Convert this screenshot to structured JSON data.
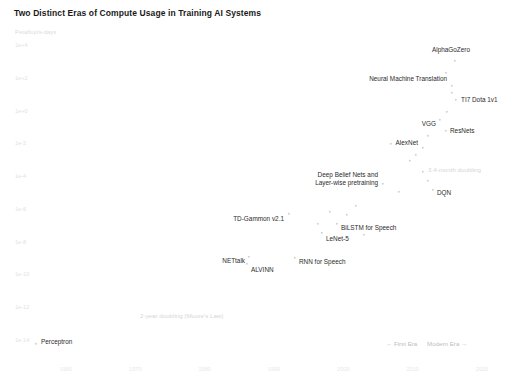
{
  "chart_data": {
    "type": "scatter",
    "title": "Two Distinct Eras of Compute Usage in Training AI Systems",
    "ylabel": "Petaflop/s-days",
    "xlabel": "",
    "xlim": [
      1955,
      2022
    ],
    "ylim_log10": [
      -14,
      4
    ],
    "grid": false,
    "legend_position": "bottom-right",
    "y_ticks": [
      "1e+4",
      "1e+2",
      "1e+0",
      "1e-2",
      "1e-4",
      "1e-6",
      "1e-8",
      "1e-10",
      "1e-12",
      "1e-14"
    ],
    "x_ticks": [
      "1960",
      "1970",
      "1980",
      "1990",
      "2000",
      "2010",
      "2020"
    ],
    "points": [
      {
        "label": "AlphaGoZero",
        "x_px": 455,
        "y_px": 61,
        "lx": 470,
        "ly": 50,
        "align": "right"
      },
      {
        "label": "Neural Machine Translation",
        "x_px": 452,
        "y_px": 86,
        "lx": 447,
        "ly": 79,
        "align": "right"
      },
      {
        "label": "TI7 Dota 1v1",
        "x_px": 456,
        "y_px": 100,
        "lx": 461,
        "ly": 100,
        "align": "left"
      },
      {
        "label": "ResNets",
        "x_px": 446,
        "y_px": 131,
        "lx": 450,
        "ly": 131,
        "align": "left"
      },
      {
        "label": "VGG",
        "x_px": 440,
        "y_px": 120,
        "lx": 436,
        "ly": 124,
        "align": "right"
      },
      {
        "label": "AlexNet",
        "x_px": 423,
        "y_px": 148,
        "lx": 418,
        "ly": 143,
        "align": "right"
      },
      {
        "label": "DQN",
        "x_px": 433,
        "y_px": 190,
        "lx": 437,
        "ly": 193,
        "align": "left"
      },
      {
        "label": "Deep Belief Nets and Layer-wise pretraining",
        "x_px": 383,
        "y_px": 184,
        "lx": 378,
        "ly": 179,
        "align": "right"
      },
      {
        "label": "BiLSTM for Speech",
        "x_px": 337,
        "y_px": 224,
        "lx": 341,
        "ly": 228,
        "align": "left"
      },
      {
        "label": "LeNet-5",
        "x_px": 322,
        "y_px": 233,
        "lx": 326,
        "ly": 239,
        "align": "left"
      },
      {
        "label": "TD-Gammon v2.1",
        "x_px": 289,
        "y_px": 214,
        "lx": 284,
        "ly": 219,
        "align": "right"
      },
      {
        "label": "RNN for Speech",
        "x_px": 295,
        "y_px": 258,
        "lx": 299,
        "ly": 262,
        "align": "left"
      },
      {
        "label": "ALVINN",
        "x_px": 247,
        "y_px": 264,
        "lx": 251,
        "ly": 270,
        "align": "left"
      },
      {
        "label": "NETtalk",
        "x_px": 249,
        "y_px": 257,
        "lx": 245,
        "ly": 261,
        "align": "right"
      },
      {
        "label": "Perceptron",
        "x_px": 36,
        "y_px": 344,
        "lx": 41,
        "ly": 342,
        "align": "left"
      }
    ],
    "extra_dots": [
      {
        "x_px": 446,
        "y_px": 73
      },
      {
        "x_px": 452,
        "y_px": 93
      },
      {
        "x_px": 447,
        "y_px": 112
      },
      {
        "x_px": 428,
        "y_px": 136
      },
      {
        "x_px": 416,
        "y_px": 155
      },
      {
        "x_px": 410,
        "y_px": 161
      },
      {
        "x_px": 423,
        "y_px": 172
      },
      {
        "x_px": 428,
        "y_px": 181
      },
      {
        "x_px": 399,
        "y_px": 192
      },
      {
        "x_px": 356,
        "y_px": 206
      },
      {
        "x_px": 347,
        "y_px": 215
      },
      {
        "x_px": 330,
        "y_px": 212
      },
      {
        "x_px": 318,
        "y_px": 224
      },
      {
        "x_px": 364,
        "y_px": 235
      },
      {
        "x_px": 391,
        "y_px": 144
      }
    ],
    "annotations": [
      {
        "text": "3.4-month doubling",
        "x_px": 428,
        "y_px": 166
      },
      {
        "text": "2-year doubling (Moore's Law)",
        "x_px": 140,
        "y_px": 312
      }
    ],
    "legend": [
      {
        "label": "← First Era"
      },
      {
        "label": "Modern Era →"
      }
    ]
  }
}
